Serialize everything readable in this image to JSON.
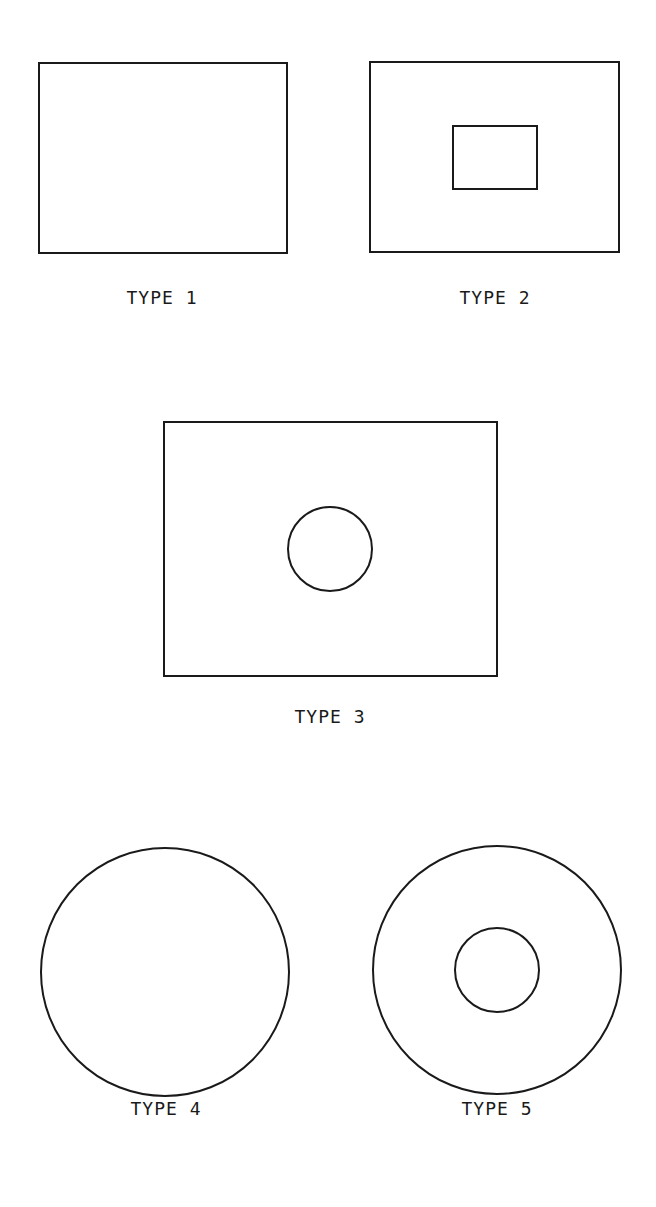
{
  "diagram": {
    "stroke_color": "#1a1a1a",
    "background": "#ffffff",
    "figures": [
      {
        "label": "TYPE 1",
        "description": "plain rectangle",
        "outer": {
          "shape": "rect",
          "x": 39,
          "y": 63,
          "w": 248,
          "h": 190
        },
        "inner": null,
        "label_pos": {
          "x": 162,
          "y": 287
        }
      },
      {
        "label": "TYPE 2",
        "description": "rectangle with centered rectangular hole",
        "outer": {
          "shape": "rect",
          "x": 370,
          "y": 62,
          "w": 249,
          "h": 190
        },
        "inner": {
          "shape": "rect",
          "x": 453,
          "y": 126,
          "w": 84,
          "h": 63
        },
        "label_pos": {
          "x": 495,
          "y": 287
        }
      },
      {
        "label": "TYPE 3",
        "description": "rectangle with centered circular hole",
        "outer": {
          "shape": "rect",
          "x": 164,
          "y": 422,
          "w": 333,
          "h": 254
        },
        "inner": {
          "shape": "circle",
          "cx": 330,
          "cy": 549,
          "r": 42
        },
        "label_pos": {
          "x": 330,
          "y": 706
        }
      },
      {
        "label": "TYPE 4",
        "description": "plain circle",
        "outer": {
          "shape": "circle",
          "cx": 165,
          "cy": 972,
          "r": 124
        },
        "inner": null,
        "label_pos": {
          "x": 166,
          "y": 1098
        }
      },
      {
        "label": "TYPE 5",
        "description": "circle with concentric circular hole",
        "outer": {
          "shape": "circle",
          "cx": 497,
          "cy": 970,
          "r": 124
        },
        "inner": {
          "shape": "circle",
          "cx": 497,
          "cy": 970,
          "r": 42
        },
        "label_pos": {
          "x": 497,
          "y": 1098
        }
      }
    ]
  }
}
